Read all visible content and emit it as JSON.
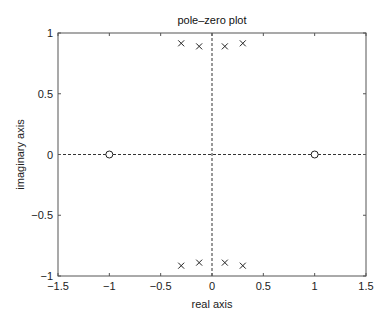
{
  "chart_data": {
    "type": "scatter",
    "title": "pole–zero plot",
    "xlabel": "real axis",
    "ylabel": "imaginary axis",
    "xlim": [
      -1.5,
      1.5
    ],
    "ylim": [
      -1,
      1
    ],
    "xticks": [
      -1.5,
      -1,
      -0.5,
      0,
      0.5,
      1,
      1.5
    ],
    "xtick_labels": [
      "−1.5",
      "−1",
      "−0.5",
      "0",
      "0.5",
      "1",
      "1.5"
    ],
    "yticks": [
      -1,
      -0.5,
      0,
      0.5,
      1
    ],
    "ytick_labels": [
      "−1",
      "−0.5",
      "0",
      "0.5",
      "1"
    ],
    "grid": false,
    "reference_lines": {
      "x": 0,
      "y": 0,
      "style": "dashed"
    },
    "series": [
      {
        "name": "poles",
        "marker": "x",
        "points": [
          [
            -0.3,
            0.915
          ],
          [
            -0.125,
            0.89
          ],
          [
            0.125,
            0.89
          ],
          [
            0.3,
            0.915
          ],
          [
            -0.3,
            -0.915
          ],
          [
            -0.125,
            -0.89
          ],
          [
            0.125,
            -0.89
          ],
          [
            0.3,
            -0.915
          ]
        ]
      },
      {
        "name": "zeros",
        "marker": "o",
        "points": [
          [
            -1,
            0
          ],
          [
            1,
            0
          ]
        ]
      }
    ]
  }
}
